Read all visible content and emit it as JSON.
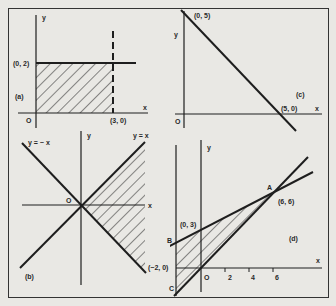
{
  "figure": {
    "background": "#e9e8e4",
    "ink": "#1e1e1e",
    "panels": {
      "a": {
        "label": "(a)",
        "axis_x": "x",
        "axis_y": "y",
        "origin": "O",
        "point_y": "(0, 2)",
        "point_x": "(3, 0)",
        "description": "Shaded rectangle 0<=x<3, 0<=y<=2; solid line y=2, dashed line x=3"
      },
      "b": {
        "label": "(b)",
        "axis_x": "x",
        "axis_y": "y",
        "origin": "O",
        "line1": "y = − x",
        "line2": "y = x",
        "description": "Lines y=x and y=-x; region to the right (x >= |y|) shaded"
      },
      "c": {
        "label": "(c)",
        "axis_x": "x",
        "axis_y": "y",
        "origin": "O",
        "point_y": "(0, 5)",
        "point_x": "(5, 0)",
        "description": "Line x + y = 5"
      },
      "d": {
        "label": "(d)",
        "axis_x": "x",
        "axis_y": "y",
        "origin": "O",
        "point_A_label": "A",
        "point_A": "(6, 6)",
        "point_B_label": "B",
        "point_B": "(0, 3)",
        "point_C_label": "C",
        "point_neg": "(−2, 0)",
        "ticks": [
          "2",
          "4",
          "6"
        ],
        "description": "Triangular region bounded by x=-2, y=x/2+3 and y=x, shaded"
      }
    }
  }
}
